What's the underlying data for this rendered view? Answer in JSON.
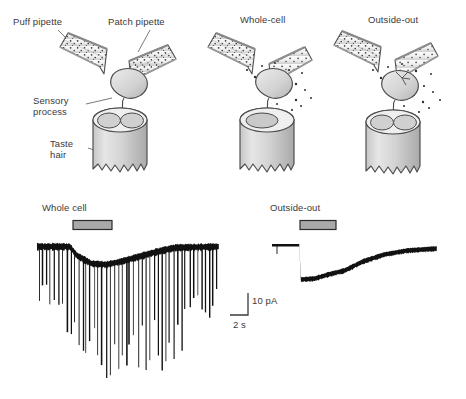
{
  "figure": {
    "title_hidden": "Patch-clamp recording from taste hair sensory process",
    "background": "#ffffff",
    "ink": "#3a3a3a"
  },
  "diagram": {
    "panels": [
      {
        "id": "panel-left",
        "header": ""
      },
      {
        "id": "panel-middle",
        "header": "Whole-cell"
      },
      {
        "id": "panel-right",
        "header": "Outside-out"
      }
    ],
    "callouts": [
      {
        "name": "puff-pipette-label",
        "text": "Puff pipette"
      },
      {
        "name": "patch-pipette-label",
        "text": "Patch pipette"
      },
      {
        "name": "sensory-process-label",
        "line1": "Sensory",
        "line2": "process"
      },
      {
        "name": "taste-hair-label",
        "line1": "Taste",
        "line2": "hair"
      }
    ],
    "colors": {
      "outline": "#4a4a4a",
      "hair_fill": "#d4d4d4",
      "hair_shade": "#b9b9b9",
      "cell_fill": "#d9d9d9",
      "pipette_fill": "#f2f2f2",
      "stipple": "#3c3c3c"
    }
  },
  "traces": {
    "stim_bar_fill": "#a9a9a9",
    "stim_bar_stroke": "#2b2b2b",
    "trace_color": "#111111",
    "whole_cell": {
      "label": "Whole cell",
      "stim_bar": {
        "x_start": 73,
        "x_end": 112
      },
      "baseline_y": 246,
      "plot": {
        "x_start": 37,
        "x_end": 219,
        "y_top": 238,
        "y_bottom": 380
      },
      "envelope": [
        {
          "x": 0.0,
          "y": 0
        },
        {
          "x": 0.18,
          "y": 0
        },
        {
          "x": 0.22,
          "y": 9
        },
        {
          "x": 0.3,
          "y": 17
        },
        {
          "x": 0.38,
          "y": 18
        },
        {
          "x": 0.46,
          "y": 15
        },
        {
          "x": 0.56,
          "y": 10
        },
        {
          "x": 0.66,
          "y": 5
        },
        {
          "x": 0.76,
          "y": 1
        },
        {
          "x": 1.0,
          "y": 0
        }
      ],
      "spike_count": 46,
      "noise_band": 6
    },
    "outside_out": {
      "label": "Outside-out",
      "stim_bar": {
        "x_start": 300,
        "x_end": 336
      },
      "baseline_y": 245,
      "plot": {
        "x_start": 272,
        "x_end": 437,
        "y_top": 240,
        "y_bottom": 285
      },
      "envelope": [
        {
          "x": 0.0,
          "y": 0
        },
        {
          "x": 0.165,
          "y": 0
        },
        {
          "x": 0.175,
          "y": 34
        },
        {
          "x": 0.26,
          "y": 33
        },
        {
          "x": 0.34,
          "y": 29
        },
        {
          "x": 0.44,
          "y": 25
        },
        {
          "x": 0.55,
          "y": 16
        },
        {
          "x": 0.68,
          "y": 9
        },
        {
          "x": 0.82,
          "y": 5
        },
        {
          "x": 1.0,
          "y": 3
        }
      ],
      "noise_band": 5
    },
    "scale_bar": {
      "current_label": "10 pA",
      "time_label": "2 s",
      "corner_x": 248,
      "corner_y": 315,
      "v_height": 22,
      "h_width": 18
    }
  },
  "chart_data": {
    "type": "line",
    "xlabel": "Time",
    "ylabel": "Current",
    "units": {
      "current": "pA",
      "time": "s"
    },
    "scale_bars": {
      "current": "10 pA",
      "time": "2 s"
    },
    "series": [
      {
        "name": "Whole cell",
        "description": "Inward current with superimposed large downward action-current spikes during stimulus",
        "stimulus_bar": "present",
        "baseline_pA": 0,
        "peak_inward_pA": -10,
        "spikes": "numerous, amplitude up to approx -60 pA"
      },
      {
        "name": "Outside-out",
        "description": "Fast inward current step at stimulus onset followed by slow decay back toward baseline",
        "stimulus_bar": "present",
        "baseline_pA": 0,
        "peak_inward_pA": -16,
        "spikes": "none"
      }
    ],
    "grid": false,
    "legend": "none"
  }
}
